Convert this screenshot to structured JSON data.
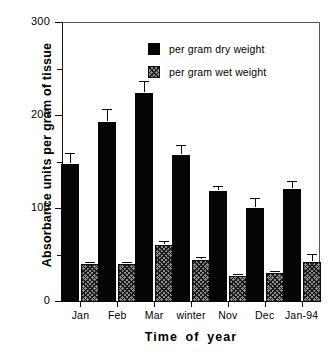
{
  "chart_data": {
    "type": "bar",
    "title": "",
    "xlabel": "Time of year",
    "ylabel": "Absorbance units per gram of tissue",
    "categories": [
      "Jan",
      "Feb",
      "Mar",
      "winter",
      "Nov",
      "Dec",
      "Jan-94"
    ],
    "ylim": [
      0,
      300
    ],
    "yticks": [
      0,
      100,
      200,
      300
    ],
    "ytick_labels": [
      "0",
      "100",
      "200",
      "300"
    ],
    "yminor_ticks": [
      50,
      150,
      250
    ],
    "grid": false,
    "legend_position": "top-right",
    "series": [
      {
        "name": "per gram dry weight",
        "color": "#050505",
        "fill": "solid",
        "values": [
          148,
          194,
          225,
          158,
          119,
          101,
          122
        ],
        "errors": [
          11,
          12,
          12,
          10,
          5,
          10,
          7
        ]
      },
      {
        "name": "per gram wet weight",
        "color": "#8d8d8d",
        "fill": "hatched",
        "values": [
          41,
          41,
          61,
          45,
          28,
          31,
          43
        ],
        "errors": [
          1,
          1,
          3,
          2,
          1,
          1,
          8
        ]
      }
    ]
  },
  "legend": {
    "entries": [
      {
        "label": "per gram dry weight",
        "swatch": "solid-black-square"
      },
      {
        "label": "per gram wet weight",
        "swatch": "hatched-gray-square"
      }
    ]
  },
  "axes": {
    "y_title": "Absorbance units per gram of tissue",
    "x_title": "Time of year",
    "y_tick_labels": [
      "300",
      "200",
      "100",
      "0"
    ],
    "x_tick_labels": [
      "Jan",
      "Feb",
      "Mar",
      "winter",
      "Nov",
      "Dec",
      "Jan-94"
    ]
  }
}
